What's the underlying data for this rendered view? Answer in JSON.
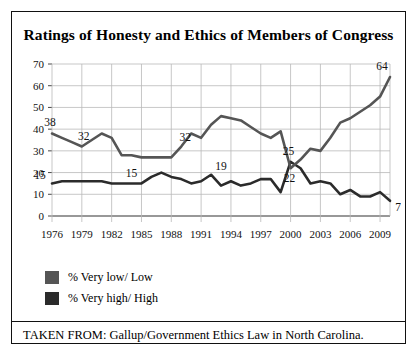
{
  "title": "Ratings of Honesty and Ethics of Members of Congress",
  "source_note": "TAKEN FROM: Gallup/Government Ethics Law in North Carolina.",
  "legend": {
    "items": [
      {
        "label": "% Very low/ Low",
        "color": "#555555"
      },
      {
        "label": "% Very high/ High",
        "color": "#2b2b2b"
      }
    ]
  },
  "chart_data": {
    "type": "line",
    "title": "Ratings of Honesty and Ethics of Members of Congress",
    "xlabel": "",
    "ylabel": "",
    "ylim": [
      0,
      70
    ],
    "ytick_step": 10,
    "yticks": [
      0,
      10,
      20,
      30,
      40,
      50,
      60,
      70
    ],
    "xlim": [
      1976,
      2010
    ],
    "xticks": [
      1976,
      1979,
      1982,
      1985,
      1988,
      1991,
      1994,
      1997,
      2000,
      2003,
      2006,
      2009
    ],
    "xtick_labels": [
      "1976",
      "1979",
      "1982",
      "1985",
      "1988",
      "1991",
      "1994",
      "1997",
      "2000",
      "2003",
      "2006",
      "2009"
    ],
    "grid": true,
    "legend_position": "below-left",
    "x": [
      1976,
      1977,
      1978,
      1979,
      1980,
      1981,
      1982,
      1983,
      1984,
      1985,
      1986,
      1987,
      1988,
      1989,
      1990,
      1991,
      1992,
      1993,
      1994,
      1995,
      1996,
      1997,
      1998,
      1999,
      2000,
      2001,
      2002,
      2003,
      2004,
      2005,
      2006,
      2007,
      2008,
      2009,
      2010
    ],
    "series": [
      {
        "name": "% Very high/ High",
        "color": "#2b2b2b",
        "values": [
          15,
          16,
          16,
          16,
          16,
          16,
          15,
          15,
          15,
          15,
          18,
          20,
          18,
          17,
          15,
          16,
          19,
          14,
          16,
          14,
          15,
          17,
          17,
          11,
          25,
          22,
          15,
          16,
          15,
          10,
          12,
          9,
          9,
          11,
          7
        ]
      },
      {
        "name": "% Very low/ Low",
        "color": "#555555",
        "values": [
          38,
          36,
          34,
          32,
          35,
          38,
          36,
          28,
          28,
          27,
          27,
          27,
          27,
          32,
          38,
          36,
          42,
          46,
          45,
          44,
          41,
          38,
          36,
          39,
          22,
          26,
          31,
          30,
          36,
          43,
          45,
          48,
          51,
          55,
          64
        ]
      }
    ],
    "point_labels": [
      {
        "series": "% Very low/ Low",
        "x": 1976,
        "value": 38
      },
      {
        "series": "% Very low/ Low",
        "x": 1979,
        "value": 32
      },
      {
        "series": "% Very low/ Low",
        "x": 1990,
        "value": 32
      },
      {
        "series": "% Very low/ Low",
        "x": 2000,
        "value": 22
      },
      {
        "series": "% Very low/ Low",
        "x": 2010,
        "value": 64
      },
      {
        "series": "% Very high/ High",
        "x": 1976,
        "value": 15
      },
      {
        "series": "% Very high/ High",
        "x": 1984,
        "value": 15
      },
      {
        "series": "% Very high/ High",
        "x": 1992,
        "value": 19
      },
      {
        "series": "% Very high/ High",
        "x": 2000,
        "value": 25
      },
      {
        "series": "% Very high/ High",
        "x": 2010,
        "value": 7
      }
    ]
  }
}
